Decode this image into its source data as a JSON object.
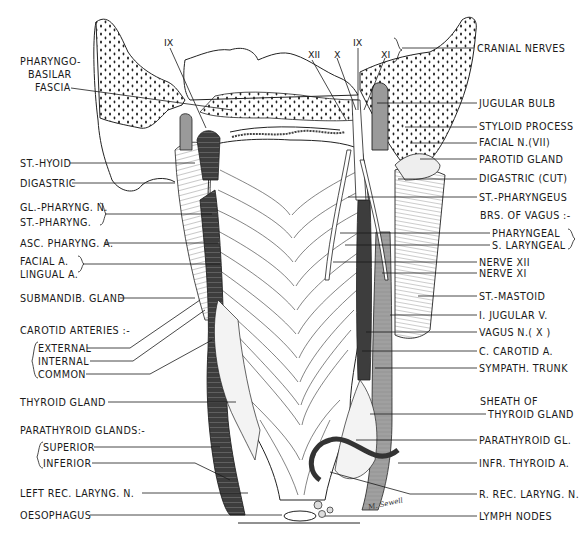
{
  "figure": {
    "signature": "M. Sewell"
  },
  "nerve_numerals": {
    "left_ix": "IX",
    "right_xii": "XII",
    "right_x": "X",
    "right_ix": "IX",
    "right_xi": "XI"
  },
  "left_labels": {
    "pharyngo_basilar_1": "PHARYNGO-",
    "pharyngo_basilar_2": "BASILAR",
    "pharyngo_basilar_3": "FASCIA",
    "st_hyoid": "ST.-HYOID",
    "digastric": "DIGASTRIC",
    "gl_pharyng_n": "GL.-PHARYNG. N.",
    "st_pharyng": "ST.-PHARYNG.",
    "asc_pharyng_a": "ASC. PHARYNG. A.",
    "facial_a": "FACIAL A.",
    "lingual_a": "LINGUAL A.",
    "submandib_gland": "SUBMANDIB. GLAND",
    "carotid_arteries": "CAROTID  ARTERIES :-",
    "external": "EXTERNAL",
    "internal": "INTERNAL",
    "common": "COMMON",
    "thyroid_gland": "THYROID  GLAND",
    "parathyroid_glands": "PARATHYROID GLANDS:-",
    "superior": "SUPERIOR",
    "inferior": "INFERIOR",
    "left_rec_laryng_n": "LEFT  REC. LARYNG. N.",
    "oesophagus": "OESOPHAGUS"
  },
  "right_labels": {
    "cranial_nerves": "CRANIAL  NERVES",
    "jugular_bulb": "JUGULAR  BULB",
    "styloid_process": "STYLOID  PROCESS",
    "facial_n_vii": "FACIAL  N.(VII)",
    "parotid_gland": "PAROTID  GLAND",
    "digastric_cut": "DIGASTRIC (CUT)",
    "st_pharyngeus": "ST.-PHARYNGEUS",
    "brs_of_vagus": "BRS. OF VAGUS :-",
    "pharyngeal": "PHARYNGEAL",
    "s_laryngeal": "S. LARYNGEAL",
    "nerve_xii": "NERVE  XII",
    "nerve_xi": "NERVE  XI",
    "st_mastoid": "ST.-MASTOID",
    "i_jugular_v": "I. JUGULAR  V.",
    "vagus_n_x": "VAGUS  N.( X )",
    "c_carotid_a": "C. CAROTID  A.",
    "sympath_trunk": "SYMPATH. TRUNK",
    "sheath_of": "SHEATH  OF",
    "thyroid_gland_sheath": "THYROID  GLAND",
    "parathyroid_gl": "PARATHYROID  GL.",
    "infr_thyroid_a": "INFR. THYROID  A.",
    "r_rec_laryng_n": "R. REC. LARYNG. N.",
    "lymph_nodes": "LYMPH  NODES"
  },
  "colors": {
    "ink": "#1a1a1a",
    "vessel_dark": "#3a3a3a",
    "vessel_mid": "#6e6e6e",
    "vein_light": "#a8a8a8",
    "paper": "#ffffff"
  }
}
